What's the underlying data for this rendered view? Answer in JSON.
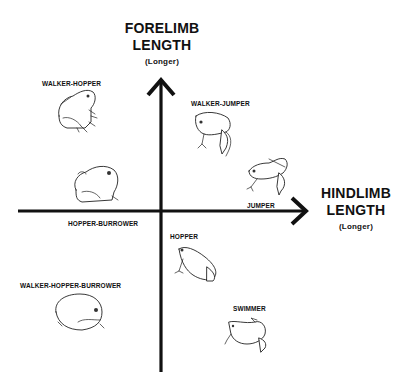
{
  "diagram": {
    "y_axis": {
      "title_line1": "FORELIMB",
      "title_line2": "LENGTH",
      "subtitle": "(Longer)"
    },
    "x_axis": {
      "title_line1": "HINDLIMB",
      "title_line2": "LENGTH",
      "subtitle": "(Longer)"
    },
    "categories": [
      {
        "label": "WALKER-HOPPER",
        "quadrant": "upper-left",
        "icon": "frog-sitting-upright"
      },
      {
        "label": "WALKER-JUMPER",
        "quadrant": "upper-right",
        "icon": "frog-long-legs"
      },
      {
        "label": "JUMPER",
        "quadrant": "upper-right",
        "icon": "frog-crouched-long-hindlimbs"
      },
      {
        "label": "HOPPER-BURROWER",
        "quadrant": "upper-left",
        "icon": "frog-round-squat"
      },
      {
        "label": "HOPPER",
        "quadrant": "lower-right",
        "icon": "frog-hopper"
      },
      {
        "label": "WALKER-HOPPER-BURROWER",
        "quadrant": "lower-left",
        "icon": "frog-globular"
      },
      {
        "label": "SWIMMER",
        "quadrant": "lower-right",
        "icon": "frog-swimming"
      }
    ]
  }
}
